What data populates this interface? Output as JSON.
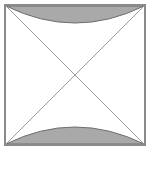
{
  "figure": {
    "name": "square-with-diagonals-and-arc-segments",
    "canvas": {
      "width": 152,
      "height": 170,
      "background_color": "#ffffff"
    },
    "square": {
      "label": "square",
      "x": 5,
      "y": 5,
      "width": 140,
      "height": 140,
      "fill_color": "#ffffff",
      "stroke_color": "#8a8a8a",
      "stroke_width": 2
    },
    "diagonals": {
      "label": "diagonals",
      "stroke_color": "#9a9a9a",
      "stroke_width": 1,
      "lines": [
        {
          "name": "diagonal-top-left-to-bottom-right",
          "x1": 6,
          "y1": 6,
          "x2": 144,
          "y2": 144
        },
        {
          "name": "diagonal-top-right-to-bottom-left",
          "x1": 144,
          "y1": 6,
          "x2": 6,
          "y2": 144
        }
      ],
      "intersection": {
        "x": 75,
        "y": 75
      }
    },
    "shaded_regions": [
      {
        "name": "top-arc-segment",
        "position": "top",
        "fill_color": "#a9a9a9",
        "stroke_color": "#6e6e6e",
        "stroke_width": 1,
        "path": "M 6 6 L 144 6 Q 75 40 6 6 Z",
        "chord_y": 6,
        "arc_apex_y": 26
      },
      {
        "name": "bottom-arc-segment",
        "position": "bottom",
        "fill_color": "#a9a9a9",
        "stroke_color": "#6e6e6e",
        "stroke_width": 1,
        "path": "M 6 144 L 144 144 Q 75 110 6 144 Z",
        "chord_y": 144,
        "arc_apex_y": 124
      }
    ]
  }
}
